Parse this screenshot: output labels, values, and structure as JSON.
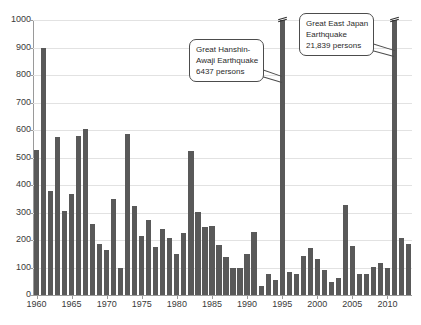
{
  "chart_data": {
    "type": "bar",
    "title": "",
    "subtitle": "",
    "xlabel": "",
    "ylabel": "",
    "ylim": [
      0,
      1000
    ],
    "ytick_step": 100,
    "ytick_labels": [
      "0",
      "100",
      "200",
      "300",
      "400",
      "500",
      "600",
      "700",
      "800",
      "900",
      "1000"
    ],
    "xtick_labels": [
      "1960",
      "1965",
      "1970",
      "1975",
      "1980",
      "1985",
      "1990",
      "1995",
      "2000",
      "2005",
      "2010"
    ],
    "grid": true,
    "legend": "none",
    "bar_color": "#595959",
    "grid_color": "#e2e2e2",
    "axis_color": "#9a9a9a",
    "categories": [
      "1960",
      "1961",
      "1962",
      "1963",
      "1964",
      "1965",
      "1966",
      "1967",
      "1968",
      "1969",
      "1970",
      "1971",
      "1972",
      "1973",
      "1974",
      "1975",
      "1976",
      "1977",
      "1978",
      "1979",
      "1980",
      "1981",
      "1982",
      "1983",
      "1984",
      "1985",
      "1986",
      "1987",
      "1988",
      "1989",
      "1990",
      "1991",
      "1992",
      "1993",
      "1994",
      "1995",
      "1996",
      "1997",
      "1998",
      "1999",
      "2000",
      "2001",
      "2002",
      "2003",
      "2004",
      "2005",
      "2006",
      "2007",
      "2008",
      "2009",
      "2010",
      "2011",
      "2012",
      "2013"
    ],
    "values": [
      528,
      900,
      378,
      575,
      307,
      368,
      578,
      605,
      259,
      187,
      163,
      350,
      100,
      585,
      322,
      213,
      273,
      174,
      239,
      208,
      150,
      225,
      524,
      301,
      249,
      251,
      181,
      138,
      97,
      97,
      148,
      229,
      32,
      76,
      56,
      6437,
      84,
      75,
      143,
      172,
      130,
      90,
      48,
      62,
      327,
      177,
      75,
      76,
      101,
      115,
      98,
      21839,
      206,
      185
    ],
    "broken_bars": [
      {
        "category": "1995",
        "value": 6437
      },
      {
        "category": "2011",
        "value": 21839
      }
    ],
    "annotations": [
      {
        "name": "great-hanshin-awaji-callout",
        "target_category": "1995",
        "lines": [
          "Great Hanshin-",
          "Awaji Earthquake",
          "6437 persons"
        ]
      },
      {
        "name": "great-east-japan-callout",
        "target_category": "2011",
        "lines": [
          "Great East Japan",
          "Earthquake",
          "21,839 persons"
        ]
      }
    ]
  }
}
